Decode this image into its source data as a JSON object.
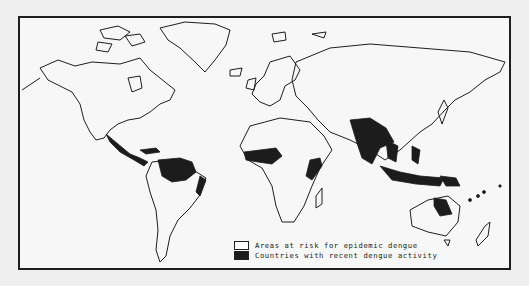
{
  "map": {
    "subject": "Global distribution of dengue",
    "colors": {
      "background": "#efefef",
      "map_fill": "#f7f7f7",
      "outline": "#1e1e1e",
      "at_risk": "#ffffff",
      "recent_activity": "#1c1c1c"
    },
    "legend": {
      "items": [
        {
          "label": "Areas at risk for epidemic dengue",
          "swatch": "white-box"
        },
        {
          "label": "Countries with recent dengue activity",
          "swatch": "black-box"
        }
      ]
    },
    "regions_recent_activity": [
      "Mexico / Central America",
      "Caribbean",
      "Northern South America (Venezuela, Colombia, Brazil Amazon)",
      "Eastern Brazil coast",
      "West Africa",
      "East Africa coast",
      "India / South Asia",
      "Southeast Asia",
      "Indonesia / Philippines",
      "Papua New Guinea",
      "Northeastern Australia",
      "Pacific Islands"
    ]
  }
}
